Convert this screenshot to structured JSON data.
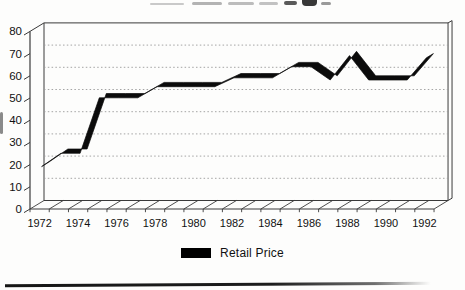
{
  "legend": {
    "label": "Retail Price",
    "swatch_color": "#000000"
  },
  "chart_data": {
    "type": "line",
    "style": "3d-ribbon-line",
    "title": "",
    "xlabel": "",
    "ylabel": "",
    "x": [
      1972,
      1973,
      1974,
      1975,
      1976,
      1977,
      1978,
      1979,
      1980,
      1981,
      1982,
      1983,
      1984,
      1985,
      1986,
      1987,
      1988,
      1989,
      1990,
      1991,
      1992
    ],
    "series": [
      {
        "name": "Retail Price",
        "color": "#0b0b0b",
        "values": [
          20,
          26,
          26,
          51,
          51,
          51,
          56,
          56,
          56,
          56,
          60,
          60,
          60,
          65,
          65,
          59,
          70,
          59,
          59,
          59,
          69
        ]
      }
    ],
    "ylim": [
      0,
      80
    ],
    "yticks": [
      0,
      10,
      20,
      30,
      40,
      50,
      60,
      70,
      80
    ],
    "x_tick_labels": [
      "1972",
      "1974",
      "1976",
      "1978",
      "1980",
      "1982",
      "1984",
      "1986",
      "1988",
      "1990",
      "1992"
    ],
    "grid": true,
    "gridline_color": "#9a9a9a",
    "axis_color": "#3a3a3a",
    "legend_position": "bottom-center"
  }
}
